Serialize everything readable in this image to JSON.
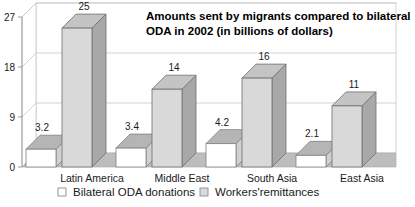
{
  "chart_data": {
    "type": "bar",
    "title": "Amounts sent by migrants compared to bilateral ODA in 2002 (in billions of dollars)",
    "title_line1": "Amounts sent by migrants compared to bilateral",
    "title_line2": "ODA in 2002 (in billions of dollars)",
    "xlabel": "",
    "ylabel": "",
    "ylim": [
      0,
      27
    ],
    "yticks": [
      0,
      9,
      18,
      27
    ],
    "ytick_labels": [
      "0",
      "9",
      "18",
      "27"
    ],
    "grid": true,
    "three_d": true,
    "legend_position": "bottom",
    "categories": [
      "Latin America",
      "Middle East",
      "South Asia",
      "East Asia"
    ],
    "series": [
      {
        "name": "Bilateral ODA donations",
        "values": [
          3.2,
          3.4,
          4.2,
          2.1
        ],
        "labels": [
          "3.2",
          "3.4",
          "4.2",
          "2.1"
        ],
        "color": "#ffffff",
        "top_color": "#b5b5b5",
        "side_color": "#d0d0d0",
        "edge_color": "#808080"
      },
      {
        "name": "Workers'remittances",
        "values": [
          25,
          14,
          16,
          11
        ],
        "labels": [
          "25",
          "14",
          "16",
          "11"
        ],
        "color": "#d9d9d9",
        "top_color": "#c4c4c4",
        "side_color": "#a8a8a8",
        "edge_color": "#6e6e6e"
      }
    ],
    "floor_color": "#bdbdbd",
    "wall_color": "#ffffff",
    "gridline_color": "#c8c8c8",
    "axis_color": "#9a9a9a",
    "background": "#ffffff"
  },
  "legend": {
    "items": [
      {
        "label": "Bilateral ODA donations",
        "swatch": "#ffffff"
      },
      {
        "label": "Workers'remittances",
        "swatch": "#d9d9d9"
      }
    ]
  }
}
